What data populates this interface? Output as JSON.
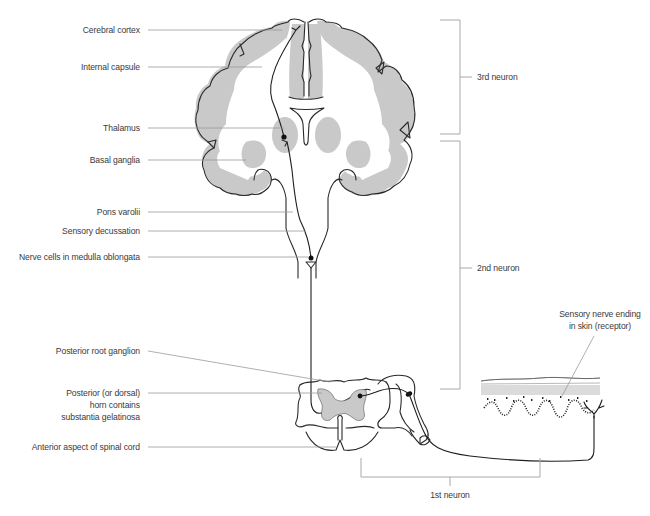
{
  "diagram": {
    "colors": {
      "grey_matter": "#c9c9c9",
      "outline": "#2a2a2a",
      "leader_line": "#9a9a9a",
      "bracket": "#a8a8a8",
      "label_text": "#3a3a3a",
      "background": "#ffffff"
    },
    "labels_left": [
      {
        "id": "cerebral-cortex",
        "text": "Cerebral cortex"
      },
      {
        "id": "internal-capsule",
        "text": "Internal capsule"
      },
      {
        "id": "thalamus",
        "text": "Thalamus"
      },
      {
        "id": "basal-ganglia",
        "text": "Basal ganglia"
      },
      {
        "id": "pons-varolii",
        "text": "Pons varolii"
      },
      {
        "id": "sensory-decussation",
        "text": "Sensory decussation"
      },
      {
        "id": "nerve-cells-medulla",
        "text": "Nerve cells in medulla oblongata"
      },
      {
        "id": "posterior-root-ganglion",
        "text": "Posterior root ganglion"
      },
      {
        "id": "posterior-horn-line1",
        "text": "Posterior (or dorsal)"
      },
      {
        "id": "posterior-horn-line2",
        "text": "horn contains"
      },
      {
        "id": "posterior-horn-line3",
        "text": "substantia gelatinosa"
      },
      {
        "id": "anterior-spinal-cord",
        "text": "Anterior aspect of spinal cord"
      }
    ],
    "labels_right": [
      {
        "id": "receptor-line1",
        "text": "Sensory nerve ending"
      },
      {
        "id": "receptor-line2",
        "text": "in skin (receptor)"
      }
    ],
    "brackets": [
      {
        "id": "third-neuron",
        "text": "3rd neuron"
      },
      {
        "id": "second-neuron",
        "text": "2nd neuron"
      },
      {
        "id": "first-neuron",
        "text": "1st neuron"
      }
    ]
  }
}
